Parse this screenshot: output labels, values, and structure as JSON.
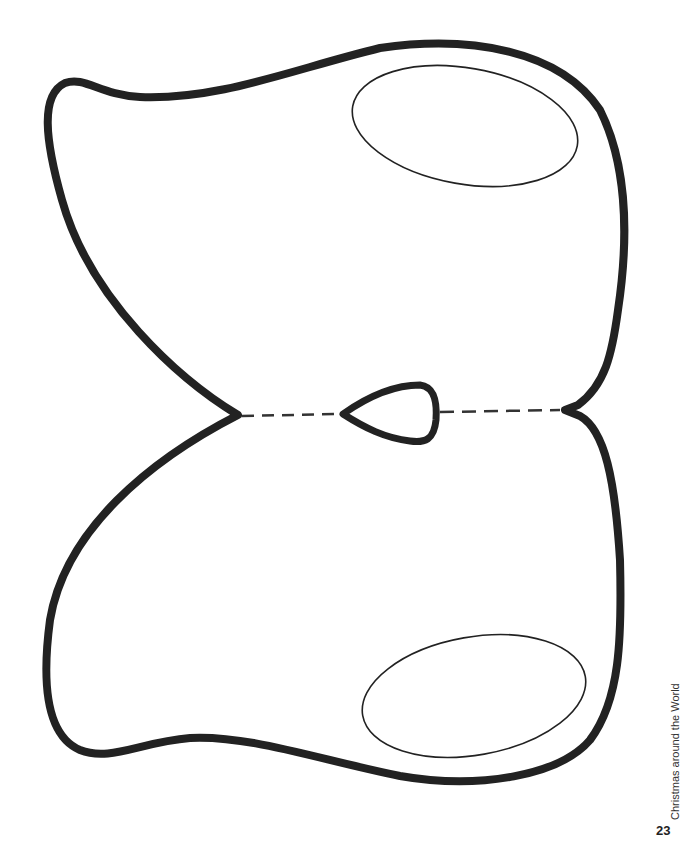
{
  "page": {
    "footer_title": "Christmas around the World",
    "page_number": "23"
  },
  "template": {
    "shape": "butterfly-shaped mask cutout",
    "outline_color": "#222222",
    "fold_line": "dashed"
  }
}
